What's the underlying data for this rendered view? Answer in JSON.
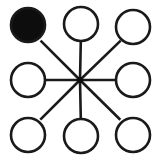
{
  "canvas": {
    "width": 160,
    "height": 161,
    "background_color": "#ffffff",
    "title": "Star graph with eight peripheral nodes and one selected node"
  },
  "style": {
    "stroke_color": "#1a1a1a",
    "node_fill_empty": "#ffffff",
    "node_fill_selected": "#0d0d0d",
    "node_stroke_width": 2.6,
    "edge_stroke_width": 2.6,
    "hub_dot_radius": 3.0
  },
  "chart_data": {
    "type": "diagram",
    "subtype": "star-graph",
    "title": "Star graph with eight peripheral nodes and one selected node",
    "node_count": 9,
    "edge_count": 8,
    "hub": {
      "id": "hub",
      "label": "center",
      "cx": 80,
      "cy": 80,
      "r": 3.0,
      "filled": true,
      "is_circle_node": false
    },
    "nodes": [
      {
        "id": "n-top-left",
        "label": "top-left",
        "cx": 28,
        "cy": 25,
        "r": 17,
        "filled": true,
        "state": "selected"
      },
      {
        "id": "n-top-center",
        "label": "top-center",
        "cx": 81,
        "cy": 24,
        "r": 17,
        "filled": false,
        "state": "empty"
      },
      {
        "id": "n-top-right",
        "label": "top-right",
        "cx": 133,
        "cy": 27,
        "r": 17,
        "filled": false,
        "state": "empty"
      },
      {
        "id": "n-middle-left",
        "label": "middle-left",
        "cx": 28,
        "cy": 80,
        "r": 17,
        "filled": false,
        "state": "empty"
      },
      {
        "id": "n-middle-right",
        "label": "middle-right",
        "cx": 133,
        "cy": 80,
        "r": 17,
        "filled": false,
        "state": "empty"
      },
      {
        "id": "n-bottom-left",
        "label": "bottom-left",
        "cx": 28,
        "cy": 135,
        "r": 17,
        "filled": false,
        "state": "empty"
      },
      {
        "id": "n-bottom-center",
        "label": "bottom-center",
        "cx": 81,
        "cy": 136,
        "r": 17,
        "filled": false,
        "state": "empty"
      },
      {
        "id": "n-bottom-right",
        "label": "bottom-right",
        "cx": 133,
        "cy": 135,
        "r": 17,
        "filled": false,
        "state": "empty"
      }
    ],
    "edges": [
      {
        "id": "e-hub-top-left",
        "from": "hub",
        "to": "n-top-left",
        "x1": 80,
        "y1": 80,
        "x2": 40.6,
        "y2": 40.6
      },
      {
        "id": "e-hub-top-center",
        "from": "hub",
        "to": "n-top-center",
        "x1": 80,
        "y1": 80,
        "x2": 80.8,
        "y2": 41.0
      },
      {
        "id": "e-hub-top-right",
        "from": "hub",
        "to": "n-top-right",
        "x1": 80,
        "y1": 80,
        "x2": 120.7,
        "y2": 40.6
      },
      {
        "id": "e-hub-middle-left",
        "from": "hub",
        "to": "n-middle-left",
        "x1": 80,
        "y1": 80,
        "x2": 45.0,
        "y2": 80.0
      },
      {
        "id": "e-hub-middle-right",
        "from": "hub",
        "to": "n-middle-right",
        "x1": 80,
        "y1": 80,
        "x2": 116.0,
        "y2": 80.0
      },
      {
        "id": "e-hub-bottom-left",
        "from": "hub",
        "to": "n-bottom-left",
        "x1": 80,
        "y1": 80,
        "x2": 40.3,
        "y2": 119.7
      },
      {
        "id": "e-hub-bottom-center",
        "from": "hub",
        "to": "n-bottom-center",
        "x1": 80,
        "y1": 80,
        "x2": 80.8,
        "y2": 119.0
      },
      {
        "id": "e-hub-bottom-right",
        "from": "hub",
        "to": "n-bottom-right",
        "x1": 80,
        "y1": 80,
        "x2": 120.3,
        "y2": 119.7
      }
    ]
  }
}
